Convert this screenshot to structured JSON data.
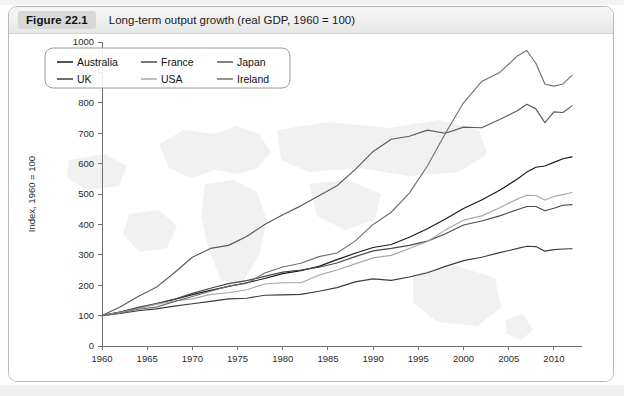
{
  "figure": {
    "badge": "Figure 22.1",
    "caption": "Long-term output growth (real GDP, 1960 = 100)"
  },
  "chart_data": {
    "type": "line",
    "title": "Long-term output growth (real GDP, 1960 = 100)",
    "xlabel": "",
    "ylabel": "Index, 1960 = 100",
    "xlim": [
      1960,
      2012
    ],
    "ylim": [
      0,
      1000
    ],
    "grid": false,
    "legend_position": "top-left",
    "xticks": [
      1960,
      1965,
      1970,
      1975,
      1980,
      1985,
      1990,
      1995,
      2000,
      2005,
      2010
    ],
    "yticks": [
      0,
      100,
      200,
      300,
      400,
      500,
      600,
      700,
      800,
      900,
      1000
    ],
    "x": [
      1960,
      1962,
      1964,
      1966,
      1968,
      1970,
      1972,
      1974,
      1976,
      1978,
      1980,
      1982,
      1984,
      1986,
      1988,
      1990,
      1992,
      1994,
      1996,
      1998,
      2000,
      2002,
      2004,
      2006,
      2007,
      2008,
      2009,
      2010,
      2011,
      2012
    ],
    "series": [
      {
        "name": "Australia",
        "color": "#1a1a1a",
        "values": [
          100,
          112,
          125,
          138,
          153,
          169,
          183,
          196,
          208,
          222,
          238,
          248,
          262,
          284,
          305,
          324,
          334,
          358,
          386,
          418,
          452,
          480,
          512,
          550,
          572,
          588,
          592,
          604,
          616,
          622
        ]
      },
      {
        "name": "UK",
        "color": "#3c3c3c",
        "values": [
          100,
          107,
          116,
          122,
          131,
          139,
          147,
          155,
          157,
          167,
          168,
          170,
          180,
          192,
          211,
          221,
          216,
          227,
          241,
          262,
          281,
          292,
          307,
          321,
          328,
          327,
          312,
          317,
          319,
          320
        ]
      },
      {
        "name": "France",
        "color": "#4a4a4a",
        "values": [
          100,
          112,
          127,
          140,
          154,
          173,
          190,
          205,
          215,
          229,
          243,
          250,
          259,
          273,
          294,
          313,
          321,
          331,
          345,
          369,
          398,
          411,
          428,
          449,
          459,
          459,
          445,
          453,
          463,
          465
        ]
      },
      {
        "name": "USA",
        "color": "#a8a8a8",
        "values": [
          100,
          110,
          123,
          137,
          148,
          155,
          170,
          175,
          185,
          204,
          208,
          208,
          233,
          250,
          270,
          290,
          298,
          321,
          344,
          382,
          414,
          428,
          455,
          484,
          496,
          495,
          480,
          492,
          498,
          505
        ]
      },
      {
        "name": "Japan",
        "color": "#5a5a5a",
        "values": [
          100,
          128,
          163,
          193,
          241,
          292,
          321,
          331,
          360,
          400,
          432,
          461,
          494,
          527,
          580,
          640,
          680,
          690,
          710,
          700,
          720,
          718,
          745,
          775,
          795,
          780,
          735,
          770,
          768,
          790
        ]
      },
      {
        "name": "Ireland",
        "color": "#707070",
        "values": [
          100,
          108,
          121,
          128,
          146,
          163,
          180,
          197,
          206,
          240,
          260,
          272,
          294,
          306,
          345,
          400,
          440,
          503,
          592,
          700,
          800,
          870,
          900,
          955,
          972,
          930,
          862,
          855,
          862,
          890
        ]
      }
    ]
  },
  "axes": {
    "y_axis_title": "Index, 1960 = 100",
    "y_tick_labels": [
      "0",
      "100",
      "200",
      "300",
      "400",
      "500",
      "600",
      "700",
      "800",
      "900",
      "1000"
    ],
    "x_tick_labels": [
      "1960",
      "1965",
      "1970",
      "1975",
      "1980",
      "1985",
      "1990",
      "1995",
      "2000",
      "2005",
      "2010"
    ]
  },
  "legend": {
    "entries": [
      {
        "label": "Australia",
        "color": "#1a1a1a"
      },
      {
        "label": "France",
        "color": "#4a4a4a"
      },
      {
        "label": "Japan",
        "color": "#5a5a5a"
      },
      {
        "label": "UK",
        "color": "#3c3c3c"
      },
      {
        "label": "USA",
        "color": "#a8a8a8"
      },
      {
        "label": "Ireland",
        "color": "#707070"
      }
    ]
  }
}
